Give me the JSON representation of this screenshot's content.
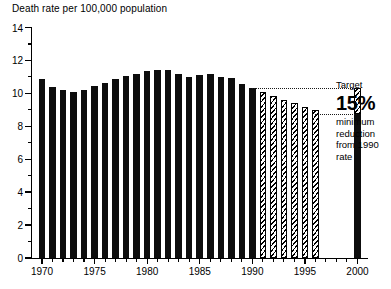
{
  "chart_data": {
    "type": "bar",
    "title": "Death rate per 100,000 population",
    "xlabel": "",
    "ylabel": "Death rate per 100,000 population",
    "ylim": [
      0,
      14
    ],
    "xlim": [
      1969,
      2001
    ],
    "grid": false,
    "legend": "none",
    "y_ticks": [
      0,
      2,
      4,
      6,
      8,
      10,
      12,
      14
    ],
    "y_tick_labels": [
      "0",
      "2",
      "4",
      "6",
      "8",
      "10",
      "12",
      "14"
    ],
    "y_minor_step": 1,
    "x_ticks": [
      1970,
      1975,
      1980,
      1985,
      1990,
      1995,
      2000
    ],
    "x_tick_labels": [
      "1970",
      "1975",
      "1980",
      "1985",
      "1990",
      "1995",
      "2000"
    ],
    "x_minor_step": 1,
    "series": [
      {
        "name": "Actual death rate",
        "style": "solid",
        "categories": [
          1970,
          1971,
          1972,
          1973,
          1974,
          1975,
          1976,
          1977,
          1978,
          1979,
          1980,
          1981,
          1982,
          1983,
          1984,
          1985,
          1986,
          1987,
          1988,
          1989,
          1990
        ],
        "values": [
          10.9,
          10.4,
          10.2,
          10.1,
          10.2,
          10.45,
          10.6,
          10.85,
          11.05,
          11.2,
          11.35,
          11.4,
          11.4,
          11.2,
          11.0,
          11.1,
          11.15,
          11.0,
          10.95,
          10.55,
          10.3
        ]
      },
      {
        "name": "Projected / required decline",
        "style": "hatched",
        "categories": [
          1991,
          1992,
          1993,
          1994,
          1995,
          1996
        ],
        "values": [
          10.1,
          9.85,
          9.6,
          9.4,
          9.15,
          9.0
        ]
      },
      {
        "name": "Target 2000",
        "style": "stacked-target",
        "categories": [
          2000
        ],
        "values": [
          8.75
        ],
        "target_top": 10.3,
        "achieved": 8.75
      }
    ],
    "annotations": [
      {
        "name": "target-leader-upper",
        "type": "dotted-line",
        "y_value": 10.3,
        "x_from": 1990,
        "x_to": 2000
      },
      {
        "name": "target-leader-lower",
        "type": "dotted-line",
        "y_value": 8.75,
        "x_from": 1996,
        "x_to": 2000
      }
    ]
  },
  "annotation": {
    "target_label": "Target",
    "percent": "15%",
    "line1": "minimum",
    "line2": "reduction",
    "line3": "from 1990",
    "line4": "rate"
  }
}
